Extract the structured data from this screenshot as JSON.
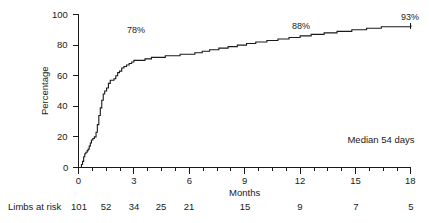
{
  "chart_data": {
    "type": "line",
    "title": "",
    "xlabel": "Months",
    "ylabel": "Percentage",
    "xlim": [
      0,
      18
    ],
    "ylim": [
      0,
      100
    ],
    "grid": false,
    "legend": null,
    "x_ticks": [
      0,
      3,
      6,
      9,
      12,
      15,
      18
    ],
    "x_tick_labels": [
      "0",
      "3",
      "6",
      "9",
      "12",
      "15",
      "18"
    ],
    "x_minor_tick_interval": 0.75,
    "y_ticks": [
      0,
      20,
      40,
      60,
      80,
      100
    ],
    "y_tick_labels": [
      "0",
      "20",
      "40",
      "60",
      "80",
      "100"
    ],
    "series": [
      {
        "name": "Cumulative percentage",
        "step": "post",
        "color": "#1a1a1a",
        "x": [
          0.0,
          0.16,
          0.16,
          0.22,
          0.28,
          0.34,
          0.4,
          0.47,
          0.52,
          0.58,
          0.64,
          0.7,
          0.78,
          0.86,
          0.95,
          1.02,
          1.1,
          1.18,
          1.26,
          1.34,
          1.42,
          1.52,
          1.62,
          1.72,
          1.8,
          1.92,
          2.02,
          2.12,
          2.22,
          2.34,
          2.46,
          2.6,
          2.74,
          2.88,
          3.0,
          3.3,
          3.6,
          3.95,
          4.3,
          4.7,
          5.1,
          5.5,
          5.9,
          6.3,
          6.7,
          7.1,
          7.6,
          8.1,
          8.6,
          9.1,
          9.6,
          10.2,
          10.8,
          11.4,
          12.0,
          12.6,
          13.3,
          14.0,
          14.8,
          15.6,
          16.4,
          17.2,
          18.0
        ],
        "y": [
          0,
          0,
          2,
          4,
          7,
          9,
          10,
          11,
          12,
          14,
          16,
          18,
          19,
          20,
          23,
          28,
          34,
          39,
          44,
          48,
          50,
          52,
          55,
          57,
          57,
          58,
          60,
          62,
          63,
          65,
          66,
          67,
          68,
          69,
          70,
          70,
          71,
          72,
          72,
          73,
          73,
          74,
          74,
          75,
          76,
          77,
          78,
          79,
          80,
          81,
          82,
          83,
          84,
          85,
          86,
          87,
          88,
          89,
          90,
          91,
          92,
          92,
          93
        ]
      }
    ],
    "annotations": [
      {
        "text": "78%",
        "x_month": 3.0,
        "y_pct": 80,
        "anchor": "curve-label"
      },
      {
        "text": "88%",
        "x_month": 11.6,
        "y_pct": 93,
        "anchor": "curve-label"
      },
      {
        "text": "93%",
        "x_month": 17.6,
        "y_pct": 99,
        "anchor": "curve-label"
      },
      {
        "text": "Median 54 days",
        "x_month": 14.9,
        "y_pct": 20,
        "anchor": "note"
      }
    ],
    "at_risk": {
      "row_label": "Limbs at risk",
      "values": [
        101,
        52,
        34,
        25,
        21,
        15,
        9,
        7,
        5
      ],
      "value_strings": [
        "101",
        "52",
        "34",
        "25",
        "21",
        "15",
        "9",
        "7",
        "5"
      ]
    }
  },
  "axes": {
    "y_title": "Percentage",
    "x_title": "Months",
    "y_labels": [
      "100",
      "80",
      "60",
      "40",
      "20",
      "0"
    ],
    "x_labels": [
      "0",
      "3",
      "6",
      "9",
      "12",
      "15",
      "18"
    ]
  },
  "annotations": {
    "pct_78": "78%",
    "pct_88": "88%",
    "pct_93": "93%",
    "median": "Median 54 days"
  },
  "at_risk": {
    "label": "Limbs at risk",
    "v0": "101",
    "v1": "52",
    "v2": "34",
    "v3": "25",
    "v4": "21",
    "v5": "15",
    "v6": "9",
    "v7": "7",
    "v8": "5"
  },
  "colors": {
    "ink": "#1a1a1a",
    "background": "#ffffff",
    "curve": "#1a1a1a"
  }
}
